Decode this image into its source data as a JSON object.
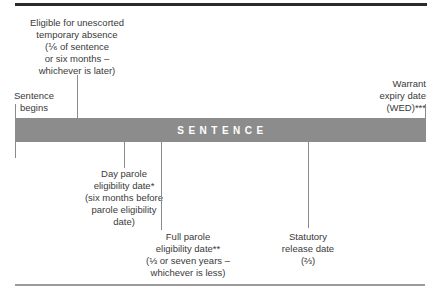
{
  "diagram": {
    "bar_label": "SENTENCE",
    "colors": {
      "bar": "#8c8c8c",
      "bar_text": "#ffffff",
      "top_rule": "#2b2b2b",
      "bottom_rule": "#9a9a9a",
      "lines": "#8a8a8a",
      "text": "#3a3a3a"
    },
    "milestones": {
      "sentence_begins": {
        "lines": [
          "Sentence",
          "begins"
        ]
      },
      "utra": {
        "lines": [
          "Eligible for unescorted",
          "temporary absence",
          "(⅙ of sentence",
          "or six months –",
          "whichever is later)"
        ]
      },
      "day_parole": {
        "lines": [
          "Day parole",
          "eligibility date*",
          "(six months before",
          "parole eligibility",
          "date)"
        ]
      },
      "full_parole": {
        "lines": [
          "Full parole",
          "eligibility date**",
          "(⅓ or seven years –",
          "whichever is less)"
        ]
      },
      "statutory_release": {
        "lines": [
          "Statutory",
          "release date",
          "(⅔)"
        ]
      },
      "wed": {
        "lines": [
          "Warrant",
          "expiry date",
          "(WED)***"
        ]
      }
    }
  }
}
